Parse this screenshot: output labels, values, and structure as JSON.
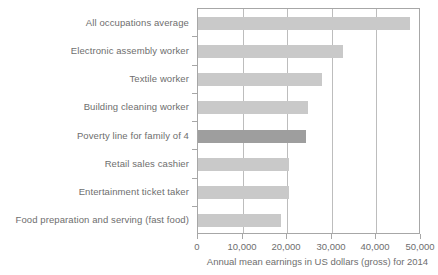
{
  "chart_data": {
    "type": "bar",
    "orientation": "horizontal",
    "title": "",
    "xlabel": "Annual mean earnings in US dollars (gross) for 2014",
    "ylabel": "",
    "xlim": [
      0,
      50000
    ],
    "xticks": [
      0,
      10000,
      20000,
      30000,
      40000,
      50000
    ],
    "xticklabels": [
      "0",
      "10,000",
      "20,000",
      "30,000",
      "40,000",
      "50,000"
    ],
    "grid": "vertical",
    "legend": "none",
    "categories": [
      "All occupations average",
      "Electronic assembly worker",
      "Textile worker",
      "Building cleaning worker",
      "Poverty line for family of 4",
      "Retail sales cashier",
      "Entertainment ticket taker",
      "Food preparation and serving (fast food)"
    ],
    "values": [
      47500,
      32500,
      27800,
      24700,
      24200,
      20400,
      20400,
      18600
    ],
    "highlight_index": 4,
    "colors": {
      "bar": "#c9c9c9",
      "bar_highlight": "#9e9e9e",
      "axis": "#a7a7a7",
      "grid": "#bdbdbd",
      "text": "#6e6e6e"
    }
  }
}
